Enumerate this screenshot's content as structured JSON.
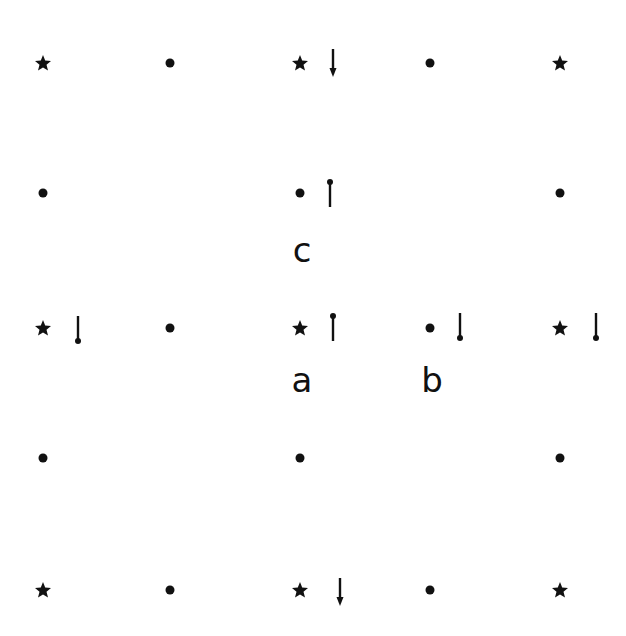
{
  "diagram": {
    "colors": {
      "ink": "#111111",
      "background": "#ffffff"
    },
    "columns_x": [
      43,
      170,
      300,
      430,
      560
    ],
    "rows_y": [
      63,
      193,
      328,
      458,
      590
    ],
    "sites": [
      {
        "row": 0,
        "col": 0,
        "type": "star"
      },
      {
        "row": 0,
        "col": 1,
        "type": "dot"
      },
      {
        "row": 0,
        "col": 2,
        "type": "star"
      },
      {
        "row": 0,
        "col": 3,
        "type": "dot"
      },
      {
        "row": 0,
        "col": 4,
        "type": "star"
      },
      {
        "row": 1,
        "col": 0,
        "type": "dot"
      },
      {
        "row": 1,
        "col": 2,
        "type": "dot"
      },
      {
        "row": 1,
        "col": 4,
        "type": "dot"
      },
      {
        "row": 2,
        "col": 0,
        "type": "star"
      },
      {
        "row": 2,
        "col": 1,
        "type": "dot"
      },
      {
        "row": 2,
        "col": 2,
        "type": "star"
      },
      {
        "row": 2,
        "col": 3,
        "type": "dot"
      },
      {
        "row": 2,
        "col": 4,
        "type": "star"
      },
      {
        "row": 3,
        "col": 0,
        "type": "dot"
      },
      {
        "row": 3,
        "col": 2,
        "type": "dot"
      },
      {
        "row": 3,
        "col": 4,
        "type": "dot"
      },
      {
        "row": 4,
        "col": 0,
        "type": "star"
      },
      {
        "row": 4,
        "col": 1,
        "type": "dot"
      },
      {
        "row": 4,
        "col": 2,
        "type": "star"
      },
      {
        "row": 4,
        "col": 3,
        "type": "dot"
      },
      {
        "row": 4,
        "col": 4,
        "type": "star"
      }
    ],
    "arrows": [
      {
        "x": 333,
        "y": 63,
        "style": "arrow-down"
      },
      {
        "x": 330,
        "y": 193,
        "style": "knob-top"
      },
      {
        "x": 78,
        "y": 330,
        "style": "knob-bottom"
      },
      {
        "x": 333,
        "y": 327,
        "style": "knob-top"
      },
      {
        "x": 460,
        "y": 327,
        "style": "knob-bottom"
      },
      {
        "x": 596,
        "y": 327,
        "style": "knob-bottom"
      },
      {
        "x": 340,
        "y": 592,
        "style": "arrow-down"
      }
    ],
    "labels": [
      {
        "id": "c",
        "text": "c",
        "x": 302,
        "y": 250
      },
      {
        "id": "a",
        "text": "a",
        "x": 302,
        "y": 380
      },
      {
        "id": "b",
        "text": "b",
        "x": 432,
        "y": 380
      }
    ]
  }
}
